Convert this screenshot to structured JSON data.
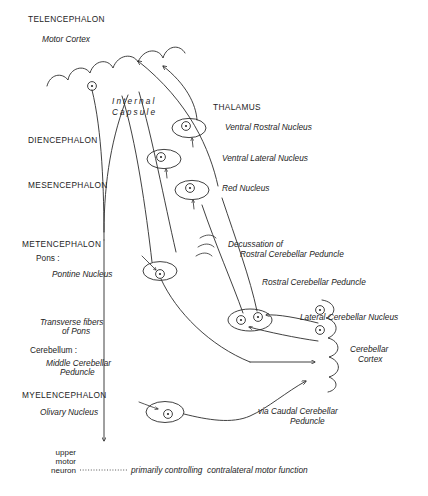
{
  "diagram": {
    "caption": "primarily controlling  contralateral motor function",
    "ink_color": "#2b2b2b",
    "background_color": "#ffffff"
  },
  "left_column": {
    "regions": [
      {
        "label": "TELENCEPHALON",
        "x": 28,
        "y": 22
      },
      {
        "label": "DIENCEPHALON",
        "x": 28,
        "y": 143
      },
      {
        "label": "MESENCEPHALON",
        "x": 28,
        "y": 188
      },
      {
        "label": "METENCEPHALON",
        "x": 22,
        "y": 247
      },
      {
        "label": "MYELENCEPHALON",
        "x": 22,
        "y": 398
      }
    ],
    "structures": [
      {
        "label": "Motor Cortex",
        "x": 42,
        "y": 42
      },
      {
        "label": "Pontine Nucleus",
        "x": 52,
        "y": 277
      },
      {
        "label": "Transverse fibers",
        "x": 40,
        "y": 325
      },
      {
        "label": "of Pons",
        "x": 62,
        "y": 334
      },
      {
        "label": "Middle Cerebellar",
        "x": 46,
        "y": 366
      },
      {
        "label": "Peduncle",
        "x": 60,
        "y": 375
      },
      {
        "label": "Olivary Nucleus",
        "x": 40,
        "y": 415
      }
    ],
    "plain": [
      {
        "label": "Pons :",
        "x": 36,
        "y": 261
      },
      {
        "label": "Cerebellum :",
        "x": 30,
        "y": 353
      }
    ],
    "upper_motor_neuron": [
      "upper",
      "motor",
      "neuron"
    ]
  },
  "internal_capsule": {
    "line1": "Internal",
    "line2": "Capsule"
  },
  "right_column": {
    "heading": "THALAMUS",
    "labels": [
      {
        "label": "Ventral Rostral Nucleus",
        "x": 225,
        "y": 130
      },
      {
        "label": "Ventral Lateral Nucleus",
        "x": 222,
        "y": 161
      },
      {
        "label": "Red Nucleus",
        "x": 222,
        "y": 191
      },
      {
        "label": "Decussation of",
        "x": 228,
        "y": 247
      },
      {
        "label": "Rostral Cerebellar Peduncle",
        "x": 240,
        "y": 257
      },
      {
        "label": "Rostral Cerebellar Peduncle",
        "x": 262,
        "y": 285
      },
      {
        "label": "Lateral Cerebellar Nucleus",
        "x": 300,
        "y": 320
      },
      {
        "label": "Cerebellar",
        "x": 350,
        "y": 352
      },
      {
        "label": "Cortex",
        "x": 358,
        "y": 362
      },
      {
        "label": "via Caudal Cerebellar",
        "x": 258,
        "y": 414
      },
      {
        "label": "Peduncle",
        "x": 290,
        "y": 424
      }
    ]
  },
  "nuclei": [
    {
      "name": "ventral-rostral-nucleus",
      "cx": 188,
      "cy": 128
    },
    {
      "name": "ventral-lateral-nucleus",
      "cx": 163,
      "cy": 158
    },
    {
      "name": "red-nucleus",
      "cx": 190,
      "cy": 189
    },
    {
      "name": "pontine-nucleus",
      "cx": 158,
      "cy": 270
    },
    {
      "name": "olivary-nucleus",
      "cx": 163,
      "cy": 411
    }
  ]
}
